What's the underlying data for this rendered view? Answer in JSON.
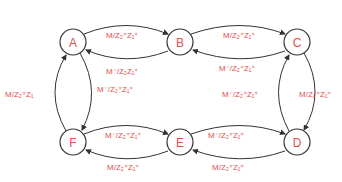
{
  "diagram": {
    "type": "state-machine",
    "colors": {
      "node_stroke": "#333333",
      "label": "#e05050",
      "edge": "#333333",
      "background": "#ffffff"
    },
    "nodes": [
      {
        "id": "A",
        "label": "A",
        "cx": 73,
        "cy": 42
      },
      {
        "id": "B",
        "label": "B",
        "cx": 180,
        "cy": 42
      },
      {
        "id": "C",
        "label": "C",
        "cx": 297,
        "cy": 42
      },
      {
        "id": "D",
        "label": "D",
        "cx": 297,
        "cy": 142
      },
      {
        "id": "E",
        "label": "E",
        "cx": 180,
        "cy": 142
      },
      {
        "id": "F",
        "label": "F",
        "cx": 73,
        "cy": 142
      }
    ],
    "edges": [
      {
        "from": "A",
        "to": "B",
        "label": "M/Z₂⁺Z₁⁺"
      },
      {
        "from": "B",
        "to": "A",
        "label": "M⁻/Z₂Z₁⁺"
      },
      {
        "from": "B",
        "to": "C",
        "label": "M/Z₂⁺Z₁⁺"
      },
      {
        "from": "C",
        "to": "B",
        "label": "M⁻/Z₂⁺Z₁⁺"
      },
      {
        "from": "C",
        "to": "D",
        "label": "M/Z₂⁺Z₁⁺"
      },
      {
        "from": "D",
        "to": "C",
        "label": "M⁻/Z₂⁺Z₁⁺"
      },
      {
        "from": "E",
        "to": "D",
        "label": "M⁻/Z₂⁺Z₁⁺"
      },
      {
        "from": "D",
        "to": "E",
        "label": "M/Z₂⁺Z₁⁺"
      },
      {
        "from": "F",
        "to": "E",
        "label": "M⁻/Z₂⁺Z₁⁺"
      },
      {
        "from": "E",
        "to": "F",
        "label": "M/Z₂⁺Z₁⁺"
      },
      {
        "from": "F",
        "to": "A",
        "label": "M/Z₂⁺Z₁"
      },
      {
        "from": "A",
        "to": "F",
        "label": "M⁻/Z₂⁺Z₁⁺"
      }
    ]
  }
}
